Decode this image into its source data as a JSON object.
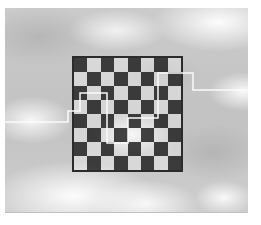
{
  "figure": {
    "page_background": "#ffffff"
  },
  "photo": {
    "x": 5,
    "y": 8,
    "width": 243,
    "height": 204,
    "sky_base_color": "#c6c6c6",
    "cloud_color": "#f5f5f5",
    "cloud_shadow_color": "#9a9a9a"
  },
  "board": {
    "x": 72,
    "y": 56,
    "width": 111,
    "height": 116,
    "rows": 8,
    "cols": 8,
    "first_square": "dark",
    "border_color": "#2b2b2b",
    "border_width": 2,
    "dark_square_color": "rgba(28,28,28,0.82)",
    "light_square_color": "rgba(255,255,255,0.30)"
  },
  "seam_path": {
    "color": "#fafafa",
    "stroke_width": 1.5,
    "points": [
      [
        5,
        122
      ],
      [
        68,
        122
      ],
      [
        68,
        111
      ],
      [
        80,
        111
      ],
      [
        80,
        93
      ],
      [
        107,
        93
      ],
      [
        107,
        143
      ],
      [
        128,
        143
      ],
      [
        128,
        118
      ],
      [
        158,
        118
      ],
      [
        158,
        73
      ],
      [
        193,
        73
      ],
      [
        193,
        90
      ],
      [
        248,
        90
      ]
    ]
  }
}
